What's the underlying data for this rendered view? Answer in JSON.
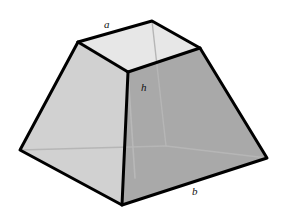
{
  "figure": {
    "name": "truncated-square-pyramid",
    "background_color": "#ffffff",
    "outline_color": "#000000",
    "outline_width": 3,
    "hidden_edge_color": "#b6b6b6",
    "hidden_edge_width": 1.4,
    "faces": {
      "top": {
        "name": "top-face",
        "fill": "#e7e7e7",
        "points": "78,42 152,21 200,48 128,72"
      },
      "left": {
        "name": "left-face",
        "fill": "#d1d1d1",
        "points": "78,42 128,72 122,205 20,150"
      },
      "right_front": {
        "name": "right-front-face",
        "fill": "#a9a9a9",
        "points": "128,72 200,48 267,158 122,205"
      }
    },
    "hidden_edges": [
      {
        "name": "hidden-edge-back-vertical",
        "points": "152,21 166,146"
      },
      {
        "name": "hidden-edge-back-left",
        "points": "20,150 166,146"
      },
      {
        "name": "hidden-edge-back-right",
        "points": "166,146 267,158"
      }
    ],
    "height_line": {
      "name": "height-line",
      "points": "128,72 135,178",
      "color": "#b8b8b8"
    },
    "labels": {
      "a": "a",
      "h": "h",
      "b": "b"
    },
    "label_meanings": {
      "a": "top edge length",
      "h": "height",
      "b": "bottom edge length"
    }
  }
}
